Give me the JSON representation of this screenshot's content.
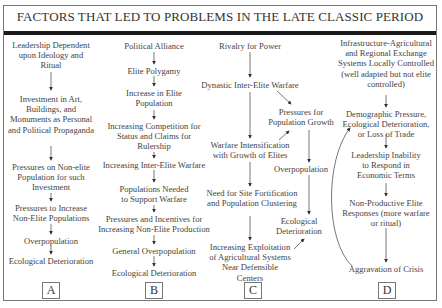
{
  "title": "FACTORS THAT LED TO PROBLEMS IN THE LATE CLASSIC PERIOD",
  "columns": {
    "A": {
      "label": "A",
      "nodes": [
        "Leadership Dependent upon Ideology and Ritual",
        "Investment in Art, Buildings, and Monuments as Personal and Political Propaganda",
        "Pressures on Non-elite Population for such Investment",
        "Pressures to Increase Non-Elite Populations",
        "Overpopulation",
        "Ecological Deterioration"
      ]
    },
    "B": {
      "label": "B",
      "nodes": [
        "Political Alliance",
        "Elite Polygamy",
        "Increase in Elite Population",
        "Increasing Competition for Status and Claims for Rulership",
        "Increasing Inter-Elite Warfare",
        "Populations Needed to Support Warfare",
        "Pressures and Incentives for Increasing Non-Elite Production",
        "General Overpopulation",
        "Ecological Deterioration"
      ]
    },
    "C": {
      "label": "C",
      "nodes": [
        "Rivalry for Power",
        "Dynastic Inter-Elite Warfare",
        "Pressures for Population Growth",
        "Warfare Intensification with Growth of Elites",
        "Overpopulation",
        "Need for Site Fortification and Population Clustering",
        "Ecological Deterioration",
        "Increasing Exploitation of Agricultural Systems Near Defensible Centers"
      ]
    },
    "D": {
      "label": "D",
      "nodes": [
        "Infrastructure-Agricultural and Regional Exchange Systems Locally Controlled (well adapted but not elite controlled)",
        "Demographic Pressure, Ecological Deterioration, or Loss of Trade",
        "Leadership Inability to Respond in Economic Terms",
        "Non-Productive Elite Responses (more warfare or ritual)",
        "Aggravation of Crisis"
      ]
    }
  },
  "colors": {
    "text": "#444444",
    "title_bar": "#1a1a1a",
    "border": "#777777"
  }
}
